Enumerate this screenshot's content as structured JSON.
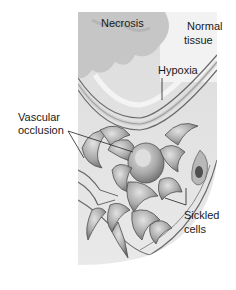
{
  "figure": {
    "labels": {
      "necrosis": "Necrosis",
      "normal_tissue_line1": "Normal",
      "normal_tissue_line2": "tissue",
      "hypoxia": "Hypoxia",
      "vascular_occlusion_line1": "Vascular",
      "vascular_occlusion_line2": "occlusion",
      "sickled_cells_line1": "Sickled",
      "sickled_cells_line2": "cells"
    },
    "colors": {
      "background": "#ffffff",
      "panel": "#e6e6e6",
      "necrosis_cloud": "#c9c9c9",
      "vessel_wall": "#bdbdbd",
      "vessel_line": "#555555",
      "cell_fill": "#9a9a9a",
      "cell_highlight": "#d2d2d2",
      "text": "#1a1a1a"
    }
  }
}
